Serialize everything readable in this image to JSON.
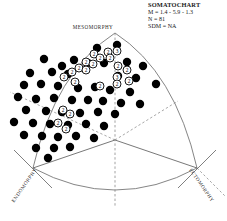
{
  "legend": {
    "title": "SOMATOCHART",
    "mean_line": "M = 1.4 - 5.9 - 1.3",
    "n_line": "N = 81",
    "sdm_line": "SDM = NA"
  },
  "axes": {
    "top": "MESOMORPHY",
    "bottom_left": "ENDOMORPHY",
    "bottom_right": "ECTOMORPHY"
  },
  "colors": {
    "point_fill": "#000000",
    "outline": "#6f6f6f",
    "divider": "#555555",
    "dashed": "#8a8a8a",
    "text": "#1a1a1a",
    "background": "#ffffff"
  },
  "chart_data": {
    "type": "scatter",
    "title": "SOMATOCHART",
    "xlabel": "",
    "ylabel": "",
    "n": 81,
    "mean_somatotype": [
      1.4,
      5.9,
      1.3
    ],
    "sdm": "NA",
    "grid": false,
    "legend_position": "top-right",
    "annotations": [
      "MESOMORPHY",
      "ENDOMORPHY",
      "ECTOMORPHY"
    ],
    "center": [
      115,
      140
    ],
    "apex_top": [
      115,
      33
    ],
    "vertex_left": [
      33,
      168
    ],
    "vertex_right": [
      197,
      168
    ],
    "points": [
      {
        "x": 44,
        "y": 59,
        "n": 1
      },
      {
        "x": 62,
        "y": 66,
        "n": 1
      },
      {
        "x": 97,
        "y": 48,
        "n": 1
      },
      {
        "x": 117,
        "y": 45,
        "n": 1
      },
      {
        "x": 74,
        "y": 60,
        "n": 1
      },
      {
        "x": 88,
        "y": 63,
        "n": 1
      },
      {
        "x": 104,
        "y": 63,
        "n": 1
      },
      {
        "x": 127,
        "y": 62,
        "n": 1
      },
      {
        "x": 143,
        "y": 66,
        "n": 1
      },
      {
        "x": 30,
        "y": 73,
        "n": 1
      },
      {
        "x": 52,
        "y": 72,
        "n": 1
      },
      {
        "x": 68,
        "y": 74,
        "n": 1
      },
      {
        "x": 118,
        "y": 76,
        "n": 1
      },
      {
        "x": 136,
        "y": 78,
        "n": 1
      },
      {
        "x": 156,
        "y": 84,
        "n": 1
      },
      {
        "x": 24,
        "y": 85,
        "n": 1
      },
      {
        "x": 41,
        "y": 84,
        "n": 1
      },
      {
        "x": 58,
        "y": 86,
        "n": 1
      },
      {
        "x": 78,
        "y": 88,
        "n": 1
      },
      {
        "x": 95,
        "y": 87,
        "n": 1
      },
      {
        "x": 110,
        "y": 90,
        "n": 1
      },
      {
        "x": 130,
        "y": 92,
        "n": 1
      },
      {
        "x": 18,
        "y": 97,
        "n": 1
      },
      {
        "x": 36,
        "y": 99,
        "n": 1
      },
      {
        "x": 54,
        "y": 98,
        "n": 1
      },
      {
        "x": 72,
        "y": 100,
        "n": 1
      },
      {
        "x": 88,
        "y": 100,
        "n": 1
      },
      {
        "x": 103,
        "y": 101,
        "n": 1
      },
      {
        "x": 121,
        "y": 103,
        "n": 1
      },
      {
        "x": 140,
        "y": 104,
        "n": 1
      },
      {
        "x": 26,
        "y": 110,
        "n": 1
      },
      {
        "x": 46,
        "y": 111,
        "n": 1
      },
      {
        "x": 62,
        "y": 112,
        "n": 1
      },
      {
        "x": 80,
        "y": 113,
        "n": 1
      },
      {
        "x": 98,
        "y": 112,
        "n": 1
      },
      {
        "x": 115,
        "y": 114,
        "n": 1
      },
      {
        "x": 14,
        "y": 122,
        "n": 1
      },
      {
        "x": 33,
        "y": 123,
        "n": 1
      },
      {
        "x": 50,
        "y": 124,
        "n": 1
      },
      {
        "x": 68,
        "y": 125,
        "n": 1
      },
      {
        "x": 86,
        "y": 124,
        "n": 1
      },
      {
        "x": 104,
        "y": 126,
        "n": 1
      },
      {
        "x": 24,
        "y": 135,
        "n": 1
      },
      {
        "x": 42,
        "y": 136,
        "n": 1
      },
      {
        "x": 58,
        "y": 137,
        "n": 1
      },
      {
        "x": 76,
        "y": 136,
        "n": 1
      },
      {
        "x": 94,
        "y": 138,
        "n": 1
      },
      {
        "x": 36,
        "y": 148,
        "n": 1
      },
      {
        "x": 54,
        "y": 148,
        "n": 1
      },
      {
        "x": 70,
        "y": 147,
        "n": 1
      },
      {
        "x": 48,
        "y": 158,
        "n": 1
      }
    ],
    "cluster_markers": [
      {
        "x": 94,
        "y": 54,
        "label": "2"
      },
      {
        "x": 108,
        "y": 52,
        "label": "2"
      },
      {
        "x": 117,
        "y": 51,
        "label": "3"
      },
      {
        "x": 100,
        "y": 58,
        "label": "2"
      },
      {
        "x": 110,
        "y": 58,
        "label": "2"
      },
      {
        "x": 86,
        "y": 62,
        "label": "2"
      },
      {
        "x": 93,
        "y": 64,
        "label": "2"
      },
      {
        "x": 79,
        "y": 68,
        "label": "2"
      },
      {
        "x": 86,
        "y": 70,
        "label": "2"
      },
      {
        "x": 72,
        "y": 72,
        "label": "2"
      },
      {
        "x": 118,
        "y": 66,
        "label": "2"
      },
      {
        "x": 127,
        "y": 70,
        "label": "2"
      },
      {
        "x": 117,
        "y": 77,
        "label": "3"
      },
      {
        "x": 129,
        "y": 81,
        "label": "2"
      },
      {
        "x": 117,
        "y": 84,
        "label": "2"
      },
      {
        "x": 100,
        "y": 86,
        "label": "2"
      },
      {
        "x": 64,
        "y": 77,
        "label": "2"
      },
      {
        "x": 75,
        "y": 82,
        "label": "2"
      },
      {
        "x": 63,
        "y": 110,
        "label": "2"
      },
      {
        "x": 70,
        "y": 114,
        "label": "2"
      },
      {
        "x": 58,
        "y": 123,
        "label": "2"
      },
      {
        "x": 66,
        "y": 129,
        "label": "2"
      }
    ]
  }
}
